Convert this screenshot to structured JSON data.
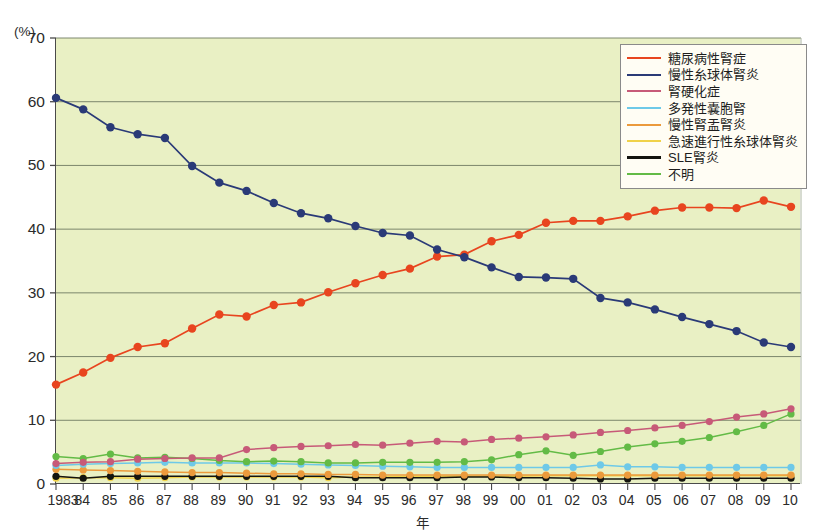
{
  "chart_data": {
    "type": "line",
    "title": "",
    "xlabel": "年",
    "ylabel": "",
    "y_unit": "(%)",
    "ylim": [
      0,
      70
    ],
    "yticks": [
      0,
      10,
      20,
      30,
      40,
      50,
      60,
      70
    ],
    "grid": true,
    "legend_position": "top-right",
    "x": [
      1983,
      1984,
      1985,
      1986,
      1987,
      1988,
      1989,
      1990,
      1991,
      1992,
      1993,
      1994,
      1995,
      1996,
      1997,
      1998,
      1999,
      2000,
      2001,
      2002,
      2003,
      2004,
      2005,
      2006,
      2007,
      2008,
      2009,
      2010
    ],
    "categories": [
      "1983",
      "84",
      "85",
      "86",
      "87",
      "88",
      "89",
      "90",
      "91",
      "92",
      "93",
      "94",
      "95",
      "96",
      "97",
      "98",
      "99",
      "00",
      "01",
      "02",
      "03",
      "04",
      "05",
      "06",
      "07",
      "08",
      "09",
      "10"
    ],
    "series": [
      {
        "name": "糖尿病性腎症",
        "color": "#e8451f",
        "values": [
          15.6,
          17.5,
          19.8,
          21.5,
          22.1,
          24.4,
          26.6,
          26.3,
          28.1,
          28.5,
          30.1,
          31.5,
          32.8,
          33.8,
          35.7,
          36.0,
          38.1,
          39.1,
          41.0,
          41.3,
          41.3,
          42.0,
          42.9,
          43.4,
          43.4,
          43.3,
          44.5,
          43.5
        ]
      },
      {
        "name": "慢性糸球体腎炎",
        "color": "#2a3a77",
        "values": [
          60.6,
          58.8,
          56.0,
          54.9,
          54.3,
          49.9,
          47.3,
          46.0,
          44.1,
          42.5,
          41.7,
          40.5,
          39.4,
          39.0,
          36.8,
          35.6,
          34.0,
          32.5,
          32.4,
          32.2,
          29.2,
          28.5,
          27.4,
          26.2,
          25.1,
          24.0,
          22.2,
          21.5
        ]
      },
      {
        "name": "腎硬化症",
        "color": "#c75a78",
        "values": [
          3.2,
          3.4,
          3.5,
          3.9,
          4.0,
          4.1,
          4.1,
          5.4,
          5.7,
          5.9,
          6.0,
          6.2,
          6.1,
          6.4,
          6.7,
          6.6,
          7.0,
          7.2,
          7.4,
          7.7,
          8.1,
          8.4,
          8.8,
          9.2,
          9.8,
          10.5,
          11.0,
          11.8
        ]
      },
      {
        "name": "多発性嚢胞腎",
        "color": "#6ec9e8",
        "values": [
          2.9,
          3.1,
          3.2,
          3.3,
          3.4,
          3.3,
          3.3,
          3.3,
          3.2,
          3.1,
          3.0,
          2.9,
          2.8,
          2.7,
          2.6,
          2.6,
          2.6,
          2.6,
          2.6,
          2.6,
          3.0,
          2.7,
          2.7,
          2.6,
          2.6,
          2.6,
          2.6,
          2.6
        ]
      },
      {
        "name": "慢性腎盂腎炎",
        "color": "#eb9a3c",
        "values": [
          2.3,
          2.2,
          2.1,
          2.0,
          1.9,
          1.8,
          1.8,
          1.7,
          1.6,
          1.6,
          1.5,
          1.5,
          1.4,
          1.4,
          1.4,
          1.4,
          1.4,
          1.4,
          1.4,
          1.4,
          1.4,
          1.4,
          1.4,
          1.4,
          1.4,
          1.4,
          1.4,
          1.4
        ]
      },
      {
        "name": "急速進行性糸球体腎炎",
        "color": "#f0d24a",
        "values": [
          0.9,
          1.0,
          1.0,
          0.9,
          1.0,
          1.1,
          1.1,
          1.1,
          1.1,
          1.1,
          1.0,
          1.1,
          1.1,
          1.2,
          1.2,
          1.2,
          1.2,
          1.2,
          1.3,
          1.3,
          1.3,
          1.3,
          1.3,
          1.3,
          1.3,
          1.3,
          1.3,
          1.3
        ]
      },
      {
        "name": "SLE腎炎",
        "color": "#14140f",
        "values": [
          1.2,
          0.9,
          1.2,
          1.2,
          1.2,
          1.2,
          1.2,
          1.2,
          1.2,
          1.2,
          1.2,
          1.0,
          1.0,
          1.0,
          1.0,
          1.1,
          1.1,
          1.0,
          1.0,
          0.9,
          0.8,
          0.8,
          0.9,
          0.9,
          0.9,
          0.9,
          0.9,
          0.9
        ]
      },
      {
        "name": "不明",
        "color": "#63bb46",
        "values": [
          4.3,
          4.0,
          4.7,
          4.1,
          4.2,
          4.0,
          3.7,
          3.5,
          3.6,
          3.5,
          3.3,
          3.3,
          3.4,
          3.4,
          3.4,
          3.5,
          3.8,
          4.6,
          5.2,
          4.5,
          5.1,
          5.8,
          6.3,
          6.7,
          7.3,
          8.2,
          9.2,
          11.0
        ]
      }
    ]
  }
}
